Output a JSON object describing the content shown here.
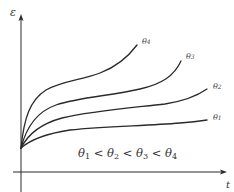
{
  "diagram": {
    "y_axis": {
      "label": "ε"
    },
    "x_axis": {
      "label": "t"
    },
    "curves": [
      {
        "id": "theta1",
        "label": "θ",
        "subscript": "1"
      },
      {
        "id": "theta2",
        "label": "θ",
        "subscript": "2"
      },
      {
        "id": "theta3",
        "label": "θ",
        "subscript": "3"
      },
      {
        "id": "theta4",
        "label": "θ",
        "subscript": "4"
      }
    ],
    "relation": {
      "parts": [
        {
          "sym": "θ",
          "sub": "1"
        },
        {
          "op": " < "
        },
        {
          "sym": "θ",
          "sub": "2"
        },
        {
          "op": " < "
        },
        {
          "sym": "θ",
          "sub": "3"
        },
        {
          "op": " < "
        },
        {
          "sym": "θ",
          "sub": "4"
        }
      ],
      "text": "θ1 < θ2 < θ3 < θ4"
    },
    "colors": {
      "line": "#2a2a2a",
      "background": "#ffffff"
    }
  }
}
